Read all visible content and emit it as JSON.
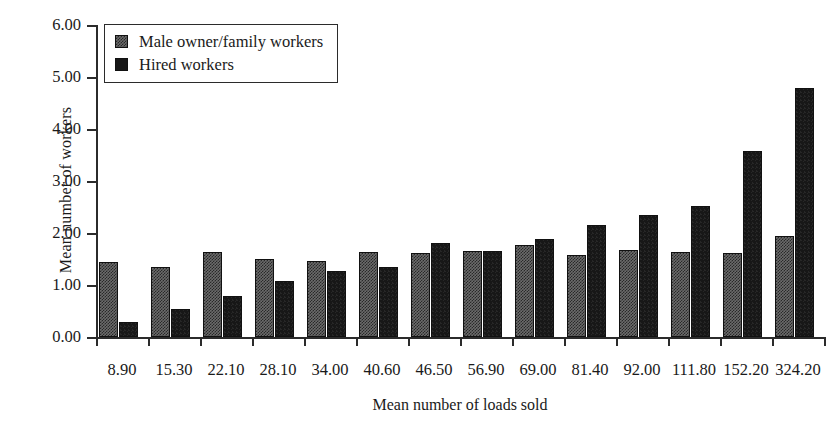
{
  "chart_data": {
    "type": "bar",
    "title": "",
    "xlabel": "Mean number of loads sold",
    "ylabel": "Mean number of workers",
    "categories": [
      "8.90",
      "15.30",
      "22.10",
      "28.10",
      "34.00",
      "40.60",
      "46.50",
      "56.90",
      "69.00",
      "81.40",
      "92.00",
      "111.80",
      "152.20",
      "324.20"
    ],
    "series": [
      {
        "name": "Male owner/family workers",
        "color": "#6b6b6b",
        "values": [
          1.45,
          1.35,
          1.63,
          1.5,
          1.46,
          1.64,
          1.61,
          1.65,
          1.76,
          1.58,
          1.68,
          1.63,
          1.62,
          1.95
        ]
      },
      {
        "name": "Hired workers",
        "color": "#171717",
        "values": [
          0.28,
          0.54,
          0.79,
          1.08,
          1.26,
          1.35,
          1.81,
          1.66,
          1.88,
          2.15,
          2.34,
          2.52,
          3.57,
          4.78
        ]
      }
    ],
    "ylim": [
      0.0,
      6.0
    ],
    "yticks": [
      "0.00",
      "1.00",
      "2.00",
      "3.00",
      "4.00",
      "5.00",
      "6.00"
    ],
    "ytick_values": [
      0,
      1,
      2,
      3,
      4,
      5,
      6
    ],
    "grid": false,
    "legend_position": "upper left"
  },
  "legend": {
    "items": [
      {
        "label": "Male owner/family workers",
        "swatch": "light"
      },
      {
        "label": "Hired workers",
        "swatch": "dark"
      }
    ]
  }
}
